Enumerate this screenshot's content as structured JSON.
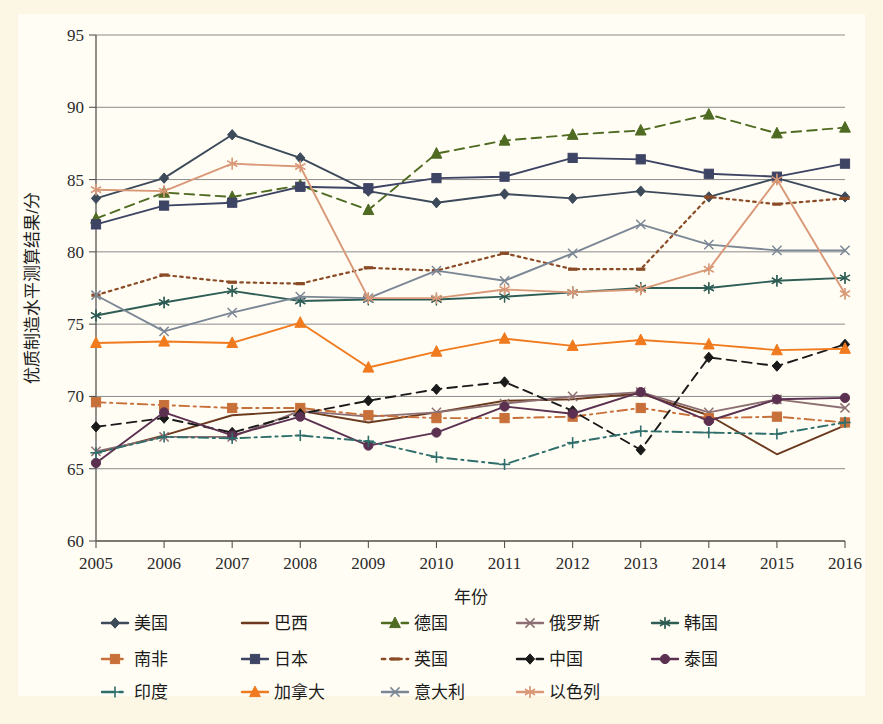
{
  "figure": {
    "background_color": "#fbf7e4",
    "plot_background_color": "#fffdf4"
  },
  "chart_data": {
    "type": "line",
    "title": "",
    "xlabel": "年份",
    "ylabel": "优质制造水平测算结果/分",
    "x": [
      2005,
      2006,
      2007,
      2008,
      2009,
      2010,
      2011,
      2012,
      2013,
      2014,
      2015,
      2016
    ],
    "categories": [
      "2005",
      "2006",
      "2007",
      "2008",
      "2009",
      "2010",
      "2011",
      "2012",
      "2013",
      "2014",
      "2015",
      "2016"
    ],
    "xlim": [
      2005,
      2016
    ],
    "ylim": [
      60,
      95
    ],
    "yticks": [
      60,
      65,
      70,
      75,
      80,
      85,
      90,
      95
    ],
    "ytick_labels": [
      "60",
      "65",
      "70",
      "75",
      "80",
      "85",
      "90",
      "95"
    ],
    "grid": true,
    "grid_axis": "y",
    "legend_position": "bottom",
    "legend_columns": 5,
    "series": [
      {
        "name": "美国",
        "color": "#3c4a5a",
        "marker": "diamond",
        "dash": "solid",
        "values": [
          83.7,
          85.1,
          88.1,
          86.5,
          84.2,
          83.4,
          84.0,
          83.7,
          84.2,
          83.8,
          85.1,
          83.8
        ]
      },
      {
        "name": "巴西",
        "color": "#6b3a1e",
        "marker": "none",
        "dash": "solid",
        "values": [
          66.1,
          67.3,
          68.7,
          69.0,
          68.2,
          68.9,
          69.7,
          69.8,
          70.2,
          68.7,
          66.0,
          68.0
        ]
      },
      {
        "name": "德国",
        "color": "#4f6b22",
        "marker": "triangle",
        "dash": "dash",
        "values": [
          82.3,
          84.1,
          83.8,
          84.6,
          82.9,
          86.8,
          87.7,
          88.1,
          88.4,
          89.5,
          88.2,
          88.6
        ]
      },
      {
        "name": "俄罗斯",
        "color": "#8d6f73",
        "marker": "x",
        "dash": "solid",
        "values": [
          66.2,
          67.2,
          67.2,
          69.0,
          68.6,
          68.9,
          69.5,
          70.0,
          70.3,
          68.9,
          69.8,
          69.2
        ]
      },
      {
        "name": "韩国",
        "color": "#2e5d55",
        "marker": "asterisk",
        "dash": "solid",
        "values": [
          75.6,
          76.5,
          77.3,
          76.6,
          76.7,
          76.7,
          76.9,
          77.2,
          77.5,
          77.5,
          78.0,
          78.2
        ]
      },
      {
        "name": "南非",
        "color": "#c8703a",
        "marker": "square",
        "dash": "dashdot",
        "values": [
          69.6,
          69.4,
          69.2,
          69.2,
          68.7,
          68.5,
          68.5,
          68.6,
          69.2,
          68.5,
          68.6,
          68.2
        ]
      },
      {
        "name": "日本",
        "color": "#3e4464",
        "marker": "square",
        "dash": "solid",
        "values": [
          81.9,
          83.2,
          83.4,
          84.5,
          84.4,
          85.1,
          85.2,
          86.5,
          86.4,
          85.4,
          85.2,
          86.1
        ]
      },
      {
        "name": "英国",
        "color": "#8a4b26",
        "marker": "dash-mark",
        "dash": "dot",
        "values": [
          77.0,
          78.4,
          77.9,
          77.8,
          78.9,
          78.7,
          79.9,
          78.8,
          78.8,
          83.8,
          83.3,
          83.7
        ]
      },
      {
        "name": "中国",
        "color": "#1a1a1a",
        "marker": "diamond",
        "dash": "dash",
        "values": [
          67.9,
          68.5,
          67.5,
          68.8,
          69.7,
          70.5,
          71.0,
          69.0,
          66.3,
          72.7,
          72.1,
          73.6
        ]
      },
      {
        "name": "泰国",
        "color": "#5b3050",
        "marker": "circle",
        "dash": "solid",
        "values": [
          65.4,
          68.9,
          67.3,
          68.6,
          66.6,
          67.5,
          69.3,
          68.8,
          70.3,
          68.3,
          69.8,
          69.9
        ]
      },
      {
        "name": "印度",
        "color": "#2f6e6b",
        "marker": "plus",
        "dash": "dashdot",
        "values": [
          66.1,
          67.2,
          67.1,
          67.3,
          66.9,
          65.8,
          65.3,
          66.8,
          67.6,
          67.5,
          67.4,
          68.2
        ]
      },
      {
        "name": "加拿大",
        "color": "#f07a1e",
        "marker": "triangle",
        "dash": "solid",
        "values": [
          73.7,
          73.8,
          73.7,
          75.1,
          72.0,
          73.1,
          74.0,
          73.5,
          73.9,
          73.6,
          73.2,
          73.3
        ]
      },
      {
        "name": "意大利",
        "color": "#7b8795",
        "marker": "x",
        "dash": "solid",
        "values": [
          77.0,
          74.5,
          75.8,
          76.9,
          76.8,
          78.7,
          78.0,
          79.9,
          81.9,
          80.5,
          80.1,
          80.1
        ]
      },
      {
        "name": "以色列",
        "color": "#d99877",
        "marker": "asterisk",
        "dash": "solid",
        "values": [
          84.3,
          84.2,
          86.1,
          85.9,
          76.8,
          76.8,
          77.4,
          77.2,
          77.4,
          78.8,
          85.0,
          77.1
        ]
      }
    ]
  },
  "legend": {
    "rows": [
      [
        "美国",
        "巴西",
        "德国",
        "俄罗斯",
        "韩国"
      ],
      [
        "南非",
        "日本",
        "英国",
        "中国",
        "泰国"
      ],
      [
        "印度",
        "加拿大",
        "意大利",
        "以色列"
      ]
    ]
  }
}
